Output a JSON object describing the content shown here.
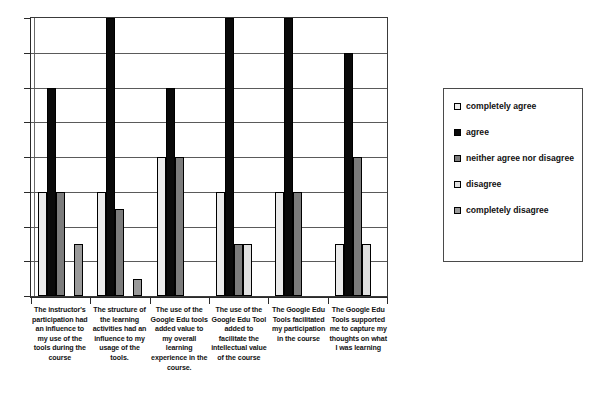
{
  "chart_data": {
    "type": "bar",
    "title": "",
    "xlabel": "",
    "ylabel": "",
    "ylim": [
      0,
      8
    ],
    "grid": true,
    "gridline_count": 8,
    "legend_position": "right",
    "axis_tick_labels": [],
    "categories": [
      "The instructor's participation had an influence to my use of the tools during the course",
      "The structure of the learning activities had an influence to my usage of the tools.",
      "The use of the Google Edu tools added value to my overall learning experience in the course.",
      "The use of the Google Edu Tool added to facilitate the intellectual value of the course",
      "The Google Edu Tools facilitated my participation in the course",
      "The Google Edu Tools supported me to capture my thoughts on what I was learning"
    ],
    "series": [
      {
        "name": "completely agree",
        "color": "#ebebeb",
        "values": [
          3,
          3,
          4,
          3,
          3,
          1.5
        ]
      },
      {
        "name": "agree",
        "color": "#0a0a0a",
        "values": [
          6,
          8,
          6,
          8,
          8,
          7
        ]
      },
      {
        "name": "neither agree nor disagree",
        "color": "#7c7c7c",
        "values": [
          3,
          2.5,
          4,
          1.5,
          3,
          4
        ]
      },
      {
        "name": "disagree",
        "color": "#e0e0e0",
        "values": [
          0,
          0,
          0,
          1.5,
          0,
          1.5
        ]
      },
      {
        "name": "completely disagree",
        "color": "#9a9a9a",
        "values": [
          1.5,
          0.5,
          0,
          0,
          0,
          0
        ]
      }
    ]
  },
  "legend": {
    "items": [
      {
        "label": "completely agree",
        "swatch": "white-swatch"
      },
      {
        "label": "agree",
        "swatch": "black-swatch"
      },
      {
        "label": "neither agree nor disagree",
        "swatch": "dark-gray-swatch"
      },
      {
        "label": "disagree",
        "swatch": "light-gray-swatch"
      },
      {
        "label": "completely disagree",
        "swatch": "medium-gray-swatch"
      }
    ]
  }
}
